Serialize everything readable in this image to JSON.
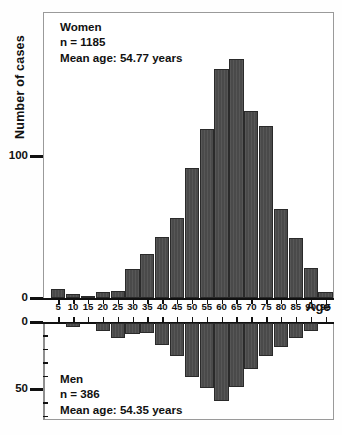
{
  "axes": {
    "y_title": "Number of cases",
    "x_title": "Age",
    "y_ticks_top": [
      "100",
      "0"
    ],
    "y_ticks_bottom": [
      "0",
      "50"
    ]
  },
  "women": {
    "group_label": "Women",
    "n_label": "n = 1185",
    "mean_label": "Mean age: 54.77 years"
  },
  "men": {
    "group_label": "Men",
    "n_label": "n = 386",
    "mean_label": "Mean age: 54.35 years"
  },
  "colors": {
    "bar_fill": "#4a4a4a",
    "bar_stroke": "#2a2a2a",
    "axis": "#111111",
    "frame": "#9a9a9a"
  },
  "chart_data": {
    "type": "bar",
    "title": "",
    "subtype": "age-pyramid-histogram",
    "xlabel": "Age",
    "ylabel": "Number of cases",
    "grid": false,
    "legend": "none",
    "categories": [
      "5",
      "10",
      "15",
      "20",
      "25",
      "30",
      "35",
      "40",
      "45",
      "50",
      "55",
      "60",
      "65",
      "70",
      "75",
      "80",
      "85",
      "90",
      "95"
    ],
    "series": [
      {
        "name": "Women",
        "n": 1185,
        "mean_age": 54.77,
        "direction": "up",
        "ylim": [
          0,
          200
        ],
        "yticks": [
          0,
          100
        ],
        "values": [
          6,
          3,
          1,
          4,
          5,
          20,
          31,
          43,
          56,
          91,
          118,
          160,
          167,
          131,
          120,
          62,
          42,
          21,
          4
        ]
      },
      {
        "name": "Men",
        "n": 386,
        "mean_age": 54.35,
        "direction": "down",
        "ylim": [
          0,
          70
        ],
        "yticks": [
          0,
          50
        ],
        "values": [
          0,
          3,
          0,
          6,
          11,
          8,
          7,
          16,
          24,
          39,
          47,
          56,
          46,
          33,
          24,
          17,
          11,
          6,
          0
        ]
      }
    ]
  }
}
